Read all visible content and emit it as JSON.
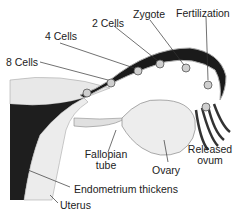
{
  "diagram": {
    "labels": {
      "eight_cells": "8 Cells",
      "four_cells": "4 Cells",
      "two_cells": "2 Cells",
      "zygote": "Zygote",
      "fertilization": "Fertilization",
      "fallopian_tube_line1": "Fallopian",
      "fallopian_tube_line2": "tube",
      "ovary": "Ovary",
      "released_ovum_line1": "Released",
      "released_ovum_line2": "ovum",
      "endometrium": "Endometrium thickens",
      "uterus": "Uterus"
    },
    "colors": {
      "background": "#ffffff",
      "tube_dark": "#1a1a1a",
      "tissue_light": "#e6e6e6",
      "label_text": "#222222",
      "leader_line": "#333333"
    }
  }
}
